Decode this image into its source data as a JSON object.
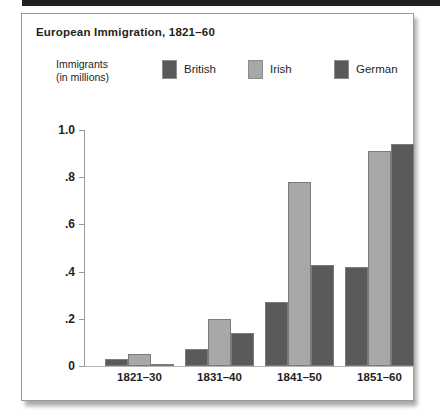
{
  "chart_data": {
    "type": "bar",
    "title": "European Immigration, 1821–60",
    "xlabel": "",
    "ylabel": "Immigrants\n(in millions)",
    "ylabel_lines": [
      "Immigrants",
      "(in millions)"
    ],
    "categories": [
      "1821–30",
      "1831–40",
      "1841–50",
      "1851–60"
    ],
    "series": [
      {
        "name": "British",
        "color": "#5a5a5a",
        "values": [
          0.03,
          0.07,
          0.27,
          0.42
        ]
      },
      {
        "name": "Irish",
        "color": "#a8a8a8",
        "values": [
          0.05,
          0.2,
          0.78,
          0.91
        ]
      },
      {
        "name": "German",
        "color": "#5a5a5a",
        "values": [
          0.01,
          0.14,
          0.43,
          0.94
        ]
      }
    ],
    "ylim": [
      0,
      1.0
    ],
    "ytick_values": [
      1.0,
      0.8,
      0.6,
      0.4,
      0.2,
      0
    ],
    "ytick_labels": [
      "1.0",
      ".8",
      ".6",
      ".4",
      ".2",
      "0"
    ],
    "grid": false,
    "legend_position": "top"
  },
  "colors": {
    "dark_bar": "#5a5a5a",
    "light_bar": "#a8a8a8",
    "axis": "#9b9b9b",
    "text": "#231f20",
    "card_border": "#9b9b9b",
    "top_rule": "#231f20"
  }
}
